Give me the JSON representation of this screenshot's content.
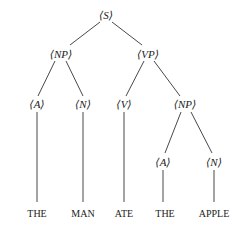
{
  "diagram": {
    "type": "parse-tree",
    "nodes": {
      "s": "⟨S⟩",
      "np1": "⟨NP⟩",
      "vp": "⟨VP⟩",
      "a1": "⟨A⟩",
      "n1": "⟨N⟩",
      "v": "⟨V⟩",
      "np2": "⟨NP⟩",
      "a2": "⟨A⟩",
      "n2": "⟨N⟩"
    },
    "leaves": {
      "w1": "THE",
      "w2": "MAN",
      "w3": "ATE",
      "w4": "THE",
      "w5": "APPLE"
    },
    "line_color": "#333333"
  }
}
